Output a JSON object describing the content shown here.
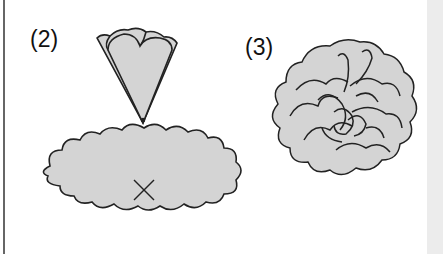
{
  "diagram": {
    "steps": [
      {
        "label": "(2)",
        "description": "Folded scalloped cone placed point-down onto the center (X) of a scalloped oval"
      },
      {
        "label": "(3)",
        "description": "Finished ruffled carnation-like flower"
      }
    ],
    "markers": {
      "center_mark": "X",
      "arrow": "down-arrow"
    },
    "colors": {
      "fill": "#d4d4d4",
      "stroke": "#222222",
      "background": "#ffffff",
      "side_band": "#ececec"
    }
  }
}
